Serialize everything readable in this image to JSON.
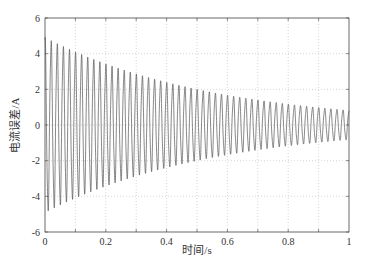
{
  "chart_data": {
    "type": "line",
    "title": "",
    "xlabel": "时间/s",
    "ylabel": "电流误差/A",
    "xlim": [
      0,
      1
    ],
    "ylim": [
      -6,
      6
    ],
    "xticks": [
      0,
      0.2,
      0.4,
      0.6,
      0.8,
      1
    ],
    "xtick_labels": [
      "0",
      "0.2",
      "0.4",
      "0.6",
      "0.8",
      "1"
    ],
    "yticks": [
      -6,
      -4,
      -2,
      0,
      2,
      4,
      6
    ],
    "ytick_labels": [
      "-6",
      "-4",
      "-2",
      "0",
      "2",
      "4",
      "6"
    ],
    "grid": true,
    "legend": null,
    "series": [
      {
        "name": "电流误差",
        "description": "decaying sinusoidal oscillation",
        "frequency_hz": 50,
        "initial_amplitude": 4.8,
        "final_amplitude": 0.8,
        "envelope_samples": {
          "t": [
            0,
            0.2,
            0.4,
            0.6,
            0.8,
            1.0
          ],
          "amplitude": [
            4.8,
            3.3,
            2.3,
            1.6,
            1.1,
            0.8
          ]
        },
        "color": "#555555"
      }
    ]
  }
}
